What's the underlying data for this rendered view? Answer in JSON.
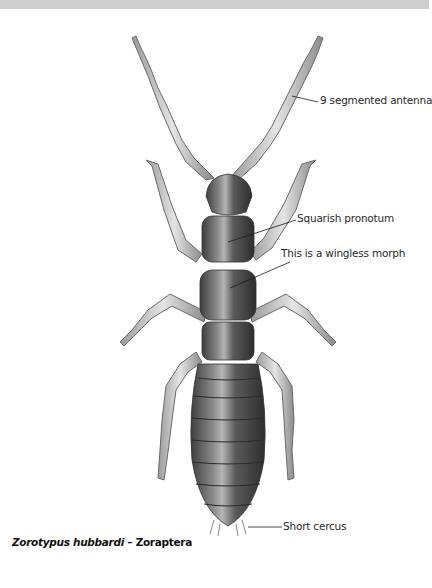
{
  "figure": {
    "caption": {
      "species": "Zorotypus hubbardi",
      "separator": " – ",
      "order": "Zoraptera"
    },
    "labels": [
      {
        "id": "antenna",
        "text": "9 segmented antenna"
      },
      {
        "id": "pronotum",
        "text": "Squarish pronotum"
      },
      {
        "id": "wingless",
        "text": "This is a wingless morph"
      },
      {
        "id": "cercus",
        "text": "Short cercus"
      }
    ],
    "colors": {
      "top_band": "#cfcfcf",
      "body_dark": "#4a4a4a",
      "body_mid": "#7a7a7a",
      "appendage": "#d6d6d6",
      "leader_line": "#1a1a1a"
    }
  }
}
